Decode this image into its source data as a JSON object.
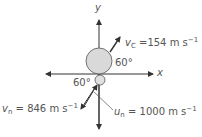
{
  "axes": {
    "x_label": "x",
    "y_label": "y"
  },
  "angles": {
    "carbon_angle": "60°",
    "neutron_angle": "60°"
  },
  "vectors": {
    "v_c": {
      "symbol": "v",
      "subscript": "C",
      "equals": "=",
      "value": "154",
      "unit": "m s",
      "exponent": "−1"
    },
    "v_n": {
      "symbol": "v",
      "subscript": "n",
      "equals": "=",
      "value": "846",
      "unit": "m s",
      "exponent": "−1"
    },
    "u_n": {
      "symbol": "u",
      "subscript": "n",
      "equals": "=",
      "value": "1000",
      "unit": "m s",
      "exponent": "−1"
    }
  },
  "colors": {
    "axis": "#333333",
    "circle_fill": "#d9d9d9",
    "circle_stroke": "#555555",
    "text": "#555555"
  }
}
